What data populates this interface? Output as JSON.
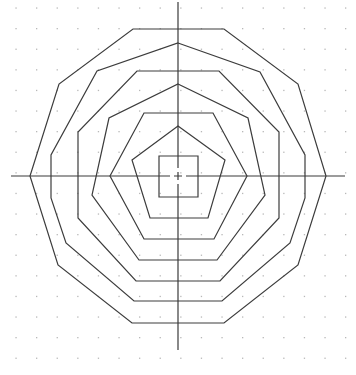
{
  "diagram": {
    "colors": {
      "background": "#ffffff",
      "line": "#3c3c3c",
      "grid": "#b8b8b8",
      "axis": "#3a3a3a"
    },
    "grid": {
      "x0": 16,
      "y0": 8,
      "spacing": 20.6,
      "cols": 17,
      "rows": 18
    },
    "axes": {
      "horizontal": {
        "x1": 11,
        "y": 176,
        "x2": 345
      },
      "vertical": {
        "x": 178,
        "y1": 2,
        "y2": 350
      }
    },
    "center_mark": {
      "x": 178,
      "y": 176
    },
    "polygons": [
      {
        "name": "outer-decagon",
        "points": "133,29 224,29 298,84 326,176 298,265 224,323 132,323 58,265 30,176 59,84"
      },
      {
        "name": "ring-2",
        "points": "178,43 260,72 305,155 305,198 290,243 222,301 134,301 66,243 51,198 51,155 97,71"
      },
      {
        "name": "ring-3",
        "points": "137,71 219,71 279,132 279,218 220,281 136,281 78,218 78,132"
      },
      {
        "name": "ring-4",
        "points": "178,84 248,118 265,195 217,260 139,260 92,195 109,118"
      },
      {
        "name": "ring-5",
        "points": "144,113 213,113 247,176 214,239 144,239 110,176"
      },
      {
        "name": "pentagon",
        "points": "178,126 225,160 208,218 150,218 132,160"
      },
      {
        "name": "square",
        "points": "159,156 198,156 198,197 159,197"
      }
    ]
  }
}
